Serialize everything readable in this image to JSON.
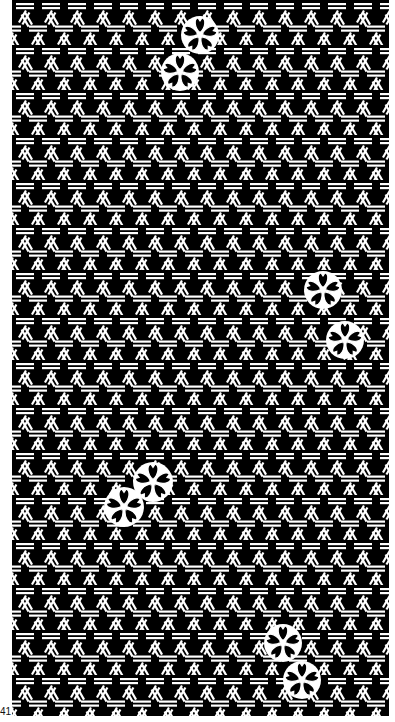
{
  "artwork": {
    "title": "Woven hexagon pattern with cherry blossoms",
    "style": "black and white line art",
    "colors": {
      "ink": "#000000",
      "paper": "#ffffff"
    },
    "pattern": {
      "name": "kagome-weave",
      "tile_width": 26,
      "tile_height": 45
    },
    "flower_clusters": [
      {
        "id": "top",
        "flowers": [
          {
            "x": 200,
            "y": 35,
            "r": 17
          },
          {
            "x": 180,
            "y": 72,
            "r": 17
          }
        ]
      },
      {
        "id": "right",
        "flowers": [
          {
            "x": 323,
            "y": 290,
            "r": 17
          },
          {
            "x": 345,
            "y": 340,
            "r": 17
          }
        ]
      },
      {
        "id": "left-middle",
        "flowers": [
          {
            "x": 153,
            "y": 482,
            "r": 18
          },
          {
            "x": 124,
            "y": 507,
            "r": 18
          }
        ]
      },
      {
        "id": "bottom",
        "flowers": [
          {
            "x": 283,
            "y": 643,
            "r": 17
          },
          {
            "x": 302,
            "y": 680,
            "r": 17
          }
        ]
      }
    ],
    "corner_label": "41"
  }
}
